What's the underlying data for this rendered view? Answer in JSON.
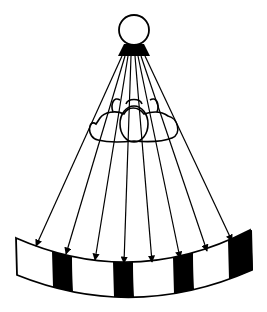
{
  "diagram": {
    "colors": {
      "ink": "#000000",
      "paper": "#ffffff"
    },
    "source": {
      "cx": 134,
      "cy": 30,
      "r": 15,
      "icon": "light-source-circle"
    },
    "emitter": {
      "points": "124,44 144,44 150,56 118,56"
    },
    "rays": [
      {
        "x1": 122,
        "y1": 56,
        "x2": 36,
        "y2": 246
      },
      {
        "x1": 125,
        "y1": 56,
        "x2": 66,
        "y2": 254
      },
      {
        "x1": 128,
        "y1": 56,
        "x2": 95,
        "y2": 260
      },
      {
        "x1": 131,
        "y1": 56,
        "x2": 124,
        "y2": 263
      },
      {
        "x1": 135,
        "y1": 56,
        "x2": 152,
        "y2": 262
      },
      {
        "x1": 138,
        "y1": 56,
        "x2": 180,
        "y2": 258
      },
      {
        "x1": 141,
        "y1": 56,
        "x2": 207,
        "y2": 251
      },
      {
        "x1": 145,
        "y1": 56,
        "x2": 232,
        "y2": 241
      }
    ],
    "object": {
      "icon": "cloud-shaped-object"
    },
    "screen": {
      "stripes": [
        {
          "fill": "#ffffff"
        },
        {
          "fill": "#000000"
        },
        {
          "fill": "#ffffff"
        },
        {
          "fill": "#000000"
        },
        {
          "fill": "#ffffff"
        },
        {
          "fill": "#000000"
        },
        {
          "fill": "#ffffff"
        },
        {
          "fill": "#000000"
        }
      ],
      "stripe_edges_x": [
        16,
        52,
        72,
        113,
        133,
        173,
        193,
        228,
        252
      ]
    }
  }
}
